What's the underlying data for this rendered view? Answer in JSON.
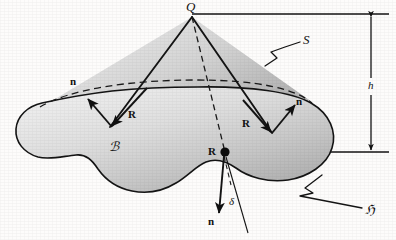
{
  "figure": {
    "background_color": "#fdfcfb",
    "ink_color": "#111111",
    "body_fill_light": "#e2e2e2",
    "body_fill_dark": "#b4b4b4",
    "cone_fill_light": "#dcdcdc",
    "cone_fill_dark": "#bdbdbd"
  },
  "labels": {
    "apex": "Q",
    "surface": "S",
    "boundary_curve": "ℌ",
    "body": "ℬ",
    "height": "h",
    "delta": "δ",
    "normal_left": "n",
    "normal_right": "n",
    "normal_bottom": "n",
    "radius_left": "R",
    "radius_right": "R",
    "radius_center": "R"
  },
  "annotations": {
    "apex_point": "Q",
    "center_point_label": "R",
    "surface_leader_label": "S",
    "curve_leader_label": "C",
    "height_dimension_label": "h"
  }
}
